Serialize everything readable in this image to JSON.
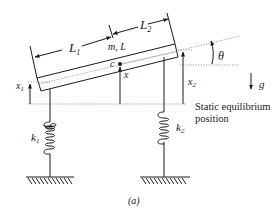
{
  "figure": {
    "caption": "(a)",
    "labels": {
      "L1": "L",
      "L1_sub": "1",
      "L2": "L",
      "L2_sub": "2",
      "mass": "m, L",
      "center": "c",
      "x": "x",
      "x1": "x",
      "x1_sub": "1",
      "x2": "x",
      "x2_sub": "2",
      "theta": "θ",
      "g": "g",
      "k1": "k",
      "k1_sub": "1",
      "k2": "k",
      "k2_sub": "2"
    },
    "annotation": {
      "line1": "Static equilibrium",
      "line2": "position"
    }
  },
  "colors": {
    "ink": "#1a1a1a",
    "dotted": "#888888",
    "background": "#ffffff"
  }
}
